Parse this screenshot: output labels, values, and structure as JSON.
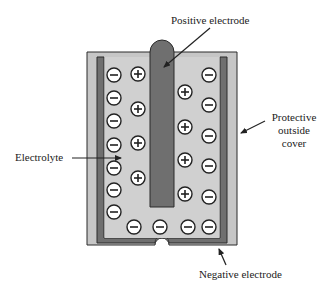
{
  "labels": {
    "positive_electrode": "Positive electrode",
    "electrolyte": "Electrolyte",
    "protective_cover_line1": "Protective",
    "protective_cover_line2": "outside",
    "protective_cover_line3": "cover",
    "negative_electrode": "Negative electrode"
  },
  "colors": {
    "outer_cover": "#c6c6c6",
    "electrode": "#6f6f6f",
    "electrolyte": "#d0d0d0",
    "outline": "#2a2a2a",
    "ion_fill": "#ffffff"
  },
  "ions": {
    "negative": [
      {
        "x": 114,
        "y": 75
      },
      {
        "x": 114,
        "y": 98
      },
      {
        "x": 114,
        "y": 121
      },
      {
        "x": 114,
        "y": 145
      },
      {
        "x": 114,
        "y": 168
      },
      {
        "x": 114,
        "y": 190
      },
      {
        "x": 114,
        "y": 212
      },
      {
        "x": 134,
        "y": 227
      },
      {
        "x": 160,
        "y": 227
      },
      {
        "x": 188,
        "y": 227
      },
      {
        "x": 209,
        "y": 227
      },
      {
        "x": 209,
        "y": 75
      },
      {
        "x": 209,
        "y": 105
      },
      {
        "x": 209,
        "y": 136
      },
      {
        "x": 209,
        "y": 166
      },
      {
        "x": 209,
        "y": 197
      }
    ],
    "positive": [
      {
        "x": 138,
        "y": 74
      },
      {
        "x": 138,
        "y": 109
      },
      {
        "x": 138,
        "y": 143
      },
      {
        "x": 138,
        "y": 178
      },
      {
        "x": 185,
        "y": 92
      },
      {
        "x": 185,
        "y": 127
      },
      {
        "x": 185,
        "y": 160
      },
      {
        "x": 185,
        "y": 194
      }
    ]
  }
}
